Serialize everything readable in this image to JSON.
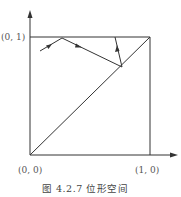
{
  "diagram": {
    "caption": "图 4.2.7   位形空间",
    "labels": {
      "top_left": "(0, 1)",
      "origin": "(0, 0)",
      "bottom_right": "(1, 0)"
    },
    "colors": {
      "line": "#333333",
      "text": "#555555",
      "background": "#ffffff"
    },
    "elements": {
      "square": {
        "from": [
          0,
          0
        ],
        "to": [
          1,
          1
        ]
      },
      "diagonal": {
        "from": [
          0,
          0
        ],
        "to": [
          1,
          1
        ]
      },
      "trajectory": [
        {
          "from": [
            0.08,
            0.88
          ],
          "to": [
            0.27,
            0.99
          ],
          "arrow": true
        },
        {
          "from": [
            0.27,
            0.99
          ],
          "to": [
            0.77,
            0.75
          ],
          "arrow": true
        },
        {
          "from": [
            0.77,
            0.75
          ],
          "to": [
            0.71,
            0.99
          ],
          "arrow": true
        }
      ]
    }
  }
}
